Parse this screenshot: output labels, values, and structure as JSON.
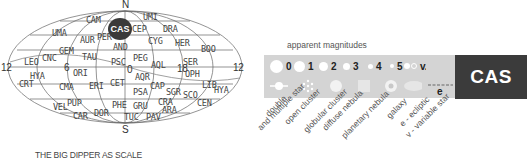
{
  "map": {
    "pole_north": "N",
    "pole_south": "S",
    "hour_labels": {
      "left": "12",
      "six": "6",
      "zero": "0",
      "eighteen": "18",
      "right": "12"
    },
    "highlight": "CAS",
    "constellations": [
      {
        "abbr": "CAM",
        "x": 86,
        "y": 16
      },
      {
        "abbr": "UMI",
        "x": 143,
        "y": 13
      },
      {
        "abbr": "CEP",
        "x": 132,
        "y": 25
      },
      {
        "abbr": "DRA",
        "x": 163,
        "y": 25
      },
      {
        "abbr": "UMA",
        "x": 52,
        "y": 29
      },
      {
        "abbr": "AUR",
        "x": 80,
        "y": 36
      },
      {
        "abbr": "PER",
        "x": 97,
        "y": 33
      },
      {
        "abbr": "CYG",
        "x": 148,
        "y": 37
      },
      {
        "abbr": "HER",
        "x": 175,
        "y": 39
      },
      {
        "abbr": "AND",
        "x": 113,
        "y": 43
      },
      {
        "abbr": "BOO",
        "x": 201,
        "y": 45
      },
      {
        "abbr": "GEM",
        "x": 59,
        "y": 47
      },
      {
        "abbr": "CNC",
        "x": 42,
        "y": 54
      },
      {
        "abbr": "LEO",
        "x": 24,
        "y": 58
      },
      {
        "abbr": "TAU",
        "x": 82,
        "y": 53
      },
      {
        "abbr": "PEG",
        "x": 133,
        "y": 54
      },
      {
        "abbr": "PSC",
        "x": 111,
        "y": 58
      },
      {
        "abbr": "SER",
        "x": 183,
        "y": 58
      },
      {
        "abbr": "AQL",
        "x": 151,
        "y": 61
      },
      {
        "abbr": "HYA",
        "x": 30,
        "y": 72
      },
      {
        "abbr": "ORI",
        "x": 73,
        "y": 69
      },
      {
        "abbr": "OPH",
        "x": 185,
        "y": 70
      },
      {
        "abbr": "AQR",
        "x": 135,
        "y": 73
      },
      {
        "abbr": "CRT",
        "x": 19,
        "y": 80
      },
      {
        "abbr": "CMA",
        "x": 59,
        "y": 83
      },
      {
        "abbr": "ERI",
        "x": 89,
        "y": 82
      },
      {
        "abbr": "CET",
        "x": 110,
        "y": 79
      },
      {
        "abbr": "CAP",
        "x": 150,
        "y": 82
      },
      {
        "abbr": "LIB",
        "x": 202,
        "y": 81
      },
      {
        "abbr": "HYA",
        "x": 214,
        "y": 86
      },
      {
        "abbr": "PSA",
        "x": 133,
        "y": 88
      },
      {
        "abbr": "SGR",
        "x": 166,
        "y": 88
      },
      {
        "abbr": "SCO",
        "x": 183,
        "y": 91
      },
      {
        "abbr": "CRA",
        "x": 158,
        "y": 98
      },
      {
        "abbr": "CEN",
        "x": 197,
        "y": 99
      },
      {
        "abbr": "VEL",
        "x": 53,
        "y": 103
      },
      {
        "abbr": "PUP",
        "x": 67,
        "y": 99
      },
      {
        "abbr": "PHE",
        "x": 112,
        "y": 101
      },
      {
        "abbr": "GRU",
        "x": 133,
        "y": 102
      },
      {
        "abbr": "ARA",
        "x": 162,
        "y": 106
      },
      {
        "abbr": "CAR",
        "x": 73,
        "y": 112
      },
      {
        "abbr": "DOR",
        "x": 94,
        "y": 109
      },
      {
        "abbr": "TUC",
        "x": 124,
        "y": 113
      },
      {
        "abbr": "PAV",
        "x": 146,
        "y": 113
      }
    ],
    "caption": "THE BIG DIPPER AS SCALE"
  },
  "legend": {
    "title": "apparent magnitudes",
    "magnitudes": [
      "0",
      "1",
      "2",
      "3",
      "4",
      "5",
      "v."
    ],
    "objects": [
      "double\nand multiple star",
      "open cluster",
      "globular cluster",
      "diffuse nebula",
      "planetary nebula",
      "galaxy",
      "e - ecliptic\nv - variable star"
    ],
    "object_labels": {
      "double_1": "double",
      "double_2": "and multiple star",
      "open": "open cluster",
      "globular": "globular cluster",
      "diffuse": "diffuse nebula",
      "planetary": "planetary nebula",
      "galaxy": "galaxy",
      "ecliptic": "e - ecliptic",
      "variable": "v - variable star"
    },
    "ecliptic_symbol": "e"
  },
  "constellation_tag": "CAS",
  "colors": {
    "legend_bg": "#d4d4d4",
    "tag_bg": "#3b3b3b",
    "line": "#555555"
  }
}
